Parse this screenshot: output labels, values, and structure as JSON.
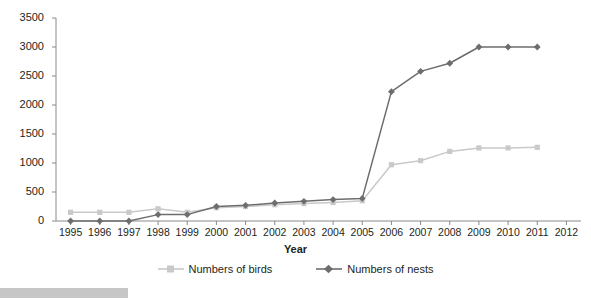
{
  "chart_data": {
    "type": "line",
    "title": "",
    "xlabel": "Year",
    "ylabel": "",
    "categories": [
      "1995",
      "1996",
      "1997",
      "1998",
      "1999",
      "2000",
      "2001",
      "2002",
      "2003",
      "2004",
      "2005",
      "2006",
      "2007",
      "2008",
      "2009",
      "2010",
      "2011"
    ],
    "x": [
      1995,
      1996,
      1997,
      1998,
      1999,
      2000,
      2001,
      2002,
      2003,
      2004,
      2005,
      2006,
      2007,
      2008,
      2009,
      2010,
      2011
    ],
    "series": [
      {
        "name": "Numbers of birds",
        "color": "#c9c9c9",
        "marker": "square",
        "values": [
          150,
          150,
          150,
          210,
          150,
          230,
          250,
          280,
          300,
          320,
          350,
          970,
          1040,
          1200,
          1260,
          1260,
          1270
        ]
      },
      {
        "name": "Numbers of nests",
        "color": "#6d6d6d",
        "marker": "diamond",
        "values": [
          0,
          0,
          0,
          110,
          110,
          250,
          270,
          310,
          340,
          370,
          390,
          2230,
          2580,
          2720,
          3000,
          3000,
          3000
        ]
      }
    ],
    "ylim": [
      0,
      3500
    ],
    "yticks": [
      0,
      500,
      1000,
      1500,
      2000,
      2500,
      3000,
      3500
    ],
    "ytick_labels": [
      "0",
      "500",
      "1000",
      "1500",
      "2000",
      "2500",
      "3000",
      "3500"
    ],
    "xlim": [
      1994.5,
      2012.5
    ],
    "xticks": [
      1995,
      1996,
      1997,
      1998,
      1999,
      2000,
      2001,
      2002,
      2003,
      2004,
      2005,
      2006,
      2007,
      2008,
      2009,
      2010,
      2011,
      2012
    ],
    "xtick_labels": [
      "1995",
      "1996",
      "1997",
      "1998",
      "1999",
      "2000",
      "2001",
      "2002",
      "2003",
      "2004",
      "2005",
      "2006",
      "2007",
      "2008",
      "2009",
      "2010",
      "2011",
      "2012"
    ],
    "grid": false,
    "legend_position": "bottom"
  },
  "axis": {
    "x_title": "Year"
  },
  "legend": {
    "entries": [
      {
        "label": "Numbers of birds"
      },
      {
        "label": "Numbers of nests"
      }
    ]
  },
  "colors": {
    "birds": "#c9c9c9",
    "nests": "#6d6d6d",
    "axis": "#8a8a8a",
    "text": "#231f20",
    "bottom_bar": "#c6c6c6"
  }
}
